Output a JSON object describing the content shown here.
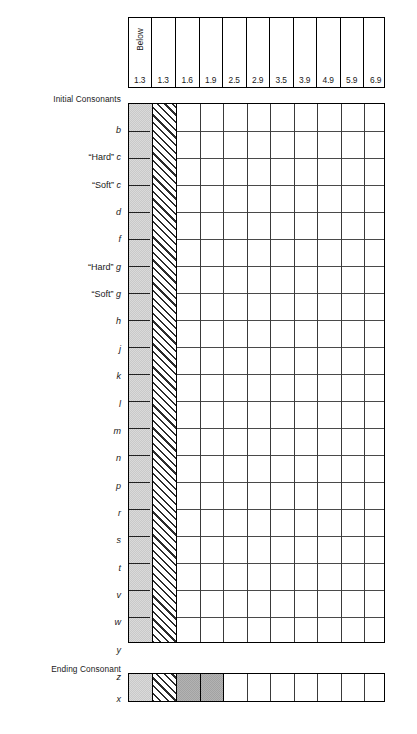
{
  "chart_data": {
    "type": "table",
    "xlabel": "Grade level",
    "ylabel": "Consonant",
    "grid": true,
    "legend_position": "none",
    "column_headers": [
      "1.3",
      "1.3",
      "1.6",
      "1.9",
      "2.5",
      "2.9",
      "3.5",
      "3.9",
      "4.9",
      "5.9",
      "6.9"
    ],
    "first_column_overhead_label": "Below",
    "column_fills": [
      "light-gray-stipple",
      "diagonal-hatch",
      "white",
      "white",
      "white",
      "white",
      "white",
      "white",
      "white",
      "white",
      "white"
    ],
    "sections": [
      {
        "name": "Initial Consonants",
        "rows": [
          {
            "label": "b",
            "fills": [
              "light-gray-stipple",
              "diagonal-hatch",
              "",
              "",
              "",
              "",
              "",
              "",
              "",
              "",
              ""
            ]
          },
          {
            "label": "“Hard” c",
            "fills": [
              "light-gray-stipple",
              "diagonal-hatch",
              "",
              "",
              "",
              "",
              "",
              "",
              "",
              "",
              ""
            ]
          },
          {
            "label": "“Soft” c",
            "fills": [
              "light-gray-stipple",
              "diagonal-hatch",
              "",
              "",
              "",
              "",
              "",
              "",
              "",
              "",
              ""
            ]
          },
          {
            "label": "d",
            "fills": [
              "light-gray-stipple",
              "diagonal-hatch",
              "",
              "",
              "",
              "",
              "",
              "",
              "",
              "",
              ""
            ]
          },
          {
            "label": "f",
            "fills": [
              "light-gray-stipple",
              "diagonal-hatch",
              "",
              "",
              "",
              "",
              "",
              "",
              "",
              "",
              ""
            ]
          },
          {
            "label": "“Hard” g",
            "fills": [
              "light-gray-stipple",
              "diagonal-hatch",
              "",
              "",
              "",
              "",
              "",
              "",
              "",
              "",
              ""
            ]
          },
          {
            "label": "“Soft” g",
            "fills": [
              "light-gray-stipple",
              "diagonal-hatch",
              "",
              "",
              "",
              "",
              "",
              "",
              "",
              "",
              ""
            ]
          },
          {
            "label": "h",
            "fills": [
              "light-gray-stipple",
              "diagonal-hatch",
              "",
              "",
              "",
              "",
              "",
              "",
              "",
              "",
              ""
            ]
          },
          {
            "label": "j",
            "fills": [
              "light-gray-stipple",
              "diagonal-hatch",
              "",
              "",
              "",
              "",
              "",
              "",
              "",
              "",
              ""
            ]
          },
          {
            "label": "k",
            "fills": [
              "light-gray-stipple",
              "diagonal-hatch",
              "",
              "",
              "",
              "",
              "",
              "",
              "",
              "",
              ""
            ]
          },
          {
            "label": "l",
            "fills": [
              "light-gray-stipple",
              "diagonal-hatch",
              "",
              "",
              "",
              "",
              "",
              "",
              "",
              "",
              ""
            ]
          },
          {
            "label": "m",
            "fills": [
              "light-gray-stipple",
              "diagonal-hatch",
              "",
              "",
              "",
              "",
              "",
              "",
              "",
              "",
              ""
            ]
          },
          {
            "label": "n",
            "fills": [
              "light-gray-stipple",
              "diagonal-hatch",
              "",
              "",
              "",
              "",
              "",
              "",
              "",
              "",
              ""
            ]
          },
          {
            "label": "p",
            "fills": [
              "light-gray-stipple",
              "diagonal-hatch",
              "",
              "",
              "",
              "",
              "",
              "",
              "",
              "",
              ""
            ]
          },
          {
            "label": "r",
            "fills": [
              "light-gray-stipple",
              "diagonal-hatch",
              "",
              "",
              "",
              "",
              "",
              "",
              "",
              "",
              ""
            ]
          },
          {
            "label": "s",
            "fills": [
              "light-gray-stipple",
              "diagonal-hatch",
              "",
              "",
              "",
              "",
              "",
              "",
              "",
              "",
              ""
            ]
          },
          {
            "label": "t",
            "fills": [
              "light-gray-stipple",
              "diagonal-hatch",
              "",
              "",
              "",
              "",
              "",
              "",
              "",
              "",
              ""
            ]
          },
          {
            "label": "v",
            "fills": [
              "light-gray-stipple",
              "diagonal-hatch",
              "",
              "",
              "",
              "",
              "",
              "",
              "",
              "",
              ""
            ]
          },
          {
            "label": "w",
            "fills": [
              "light-gray-stipple",
              "diagonal-hatch",
              "",
              "",
              "",
              "",
              "",
              "",
              "",
              "",
              ""
            ]
          },
          {
            "label": "y",
            "fills": [
              "light-gray-stipple",
              "diagonal-hatch",
              "",
              "",
              "",
              "",
              "",
              "",
              "",
              "",
              ""
            ]
          },
          {
            "label": "z",
            "fills": [
              "light-gray-stipple",
              "diagonal-hatch",
              "",
              "",
              "",
              "",
              "",
              "",
              "",
              "",
              ""
            ]
          }
        ]
      },
      {
        "name": "Ending Consonant",
        "rows": [
          {
            "label": "x",
            "fills": [
              "light-gray-stipple",
              "diagonal-hatch",
              "dark-gray-stipple",
              "dark-gray-stipple",
              "",
              "",
              "",
              "",
              "",
              "",
              ""
            ]
          }
        ]
      }
    ]
  },
  "header": {
    "below_label": "Below",
    "values": [
      "1.3",
      "1.3",
      "1.6",
      "1.9",
      "2.5",
      "2.9",
      "3.5",
      "3.9",
      "4.9",
      "5.9",
      "6.9"
    ]
  },
  "sections": {
    "initial": {
      "title": "Initial Consonants",
      "labels": [
        "b",
        "“Hard” c",
        "“Soft” c",
        "d",
        "f",
        "“Hard” g",
        "“Soft” g",
        "h",
        "j",
        "k",
        "l",
        "m",
        "n",
        "p",
        "r",
        "s",
        "t",
        "v",
        "w",
        "y",
        "z"
      ]
    },
    "ending": {
      "title": "Ending Consonant",
      "labels": [
        "x"
      ]
    }
  },
  "colors": {
    "light_fill": "#c9c9c9",
    "dark_fill": "#a2a2a2",
    "hatch_line": "#2b2b2b",
    "border": "#000000",
    "grid_line": "#4a4a4a",
    "text": "#1a1a1a"
  }
}
